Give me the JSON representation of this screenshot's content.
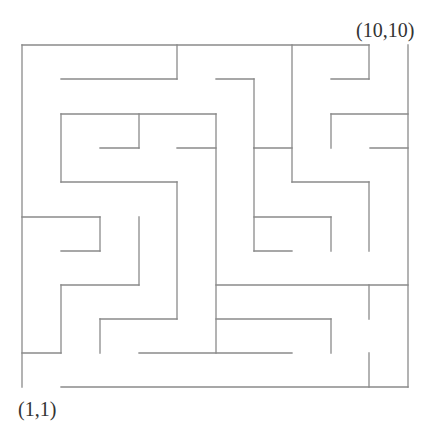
{
  "diagram": {
    "type": "maze",
    "grid_size": [
      10,
      10
    ],
    "wall_color": "#8a8a8a",
    "background": "#ffffff",
    "start_label": "(1,1)",
    "end_label": "(10,10)",
    "walls": [
      [
        22,
        45,
        369,
        45
      ],
      [
        22,
        45,
        22,
        387
      ],
      [
        408,
        45,
        408,
        387
      ],
      [
        61,
        387,
        408,
        387
      ],
      [
        177,
        45,
        177,
        79
      ],
      [
        61,
        79,
        177,
        79
      ],
      [
        216,
        79,
        254,
        79
      ],
      [
        254,
        79,
        254,
        148
      ],
      [
        292,
        45,
        292,
        182
      ],
      [
        369,
        45,
        369,
        79
      ],
      [
        331,
        79,
        369,
        79
      ],
      [
        61,
        114,
        216,
        114
      ],
      [
        61,
        114,
        61,
        182
      ],
      [
        139,
        114,
        139,
        148
      ],
      [
        100,
        148,
        139,
        148
      ],
      [
        177,
        148,
        216,
        148
      ],
      [
        216,
        114,
        216,
        353
      ],
      [
        331,
        114,
        408,
        114
      ],
      [
        331,
        114,
        331,
        148
      ],
      [
        370,
        148,
        408,
        148
      ],
      [
        254,
        148,
        292,
        148
      ],
      [
        61,
        182,
        177,
        182
      ],
      [
        177,
        182,
        177,
        319
      ],
      [
        292,
        182,
        369,
        182
      ],
      [
        369,
        182,
        369,
        251
      ],
      [
        254,
        148,
        254,
        251
      ],
      [
        254,
        217,
        331,
        217
      ],
      [
        331,
        217,
        331,
        251
      ],
      [
        254,
        251,
        292,
        251
      ],
      [
        22,
        217,
        100,
        217
      ],
      [
        100,
        217,
        100,
        251
      ],
      [
        61,
        251,
        100,
        251
      ],
      [
        139,
        217,
        139,
        285
      ],
      [
        61,
        285,
        139,
        285
      ],
      [
        61,
        285,
        61,
        353
      ],
      [
        22,
        353,
        61,
        353
      ],
      [
        100,
        319,
        177,
        319
      ],
      [
        100,
        319,
        100,
        353
      ],
      [
        139,
        353,
        292,
        353
      ],
      [
        216,
        285,
        408,
        285
      ],
      [
        369,
        285,
        369,
        319
      ],
      [
        216,
        319,
        331,
        319
      ],
      [
        331,
        319,
        331,
        353
      ],
      [
        369,
        353,
        369,
        387
      ]
    ]
  }
}
